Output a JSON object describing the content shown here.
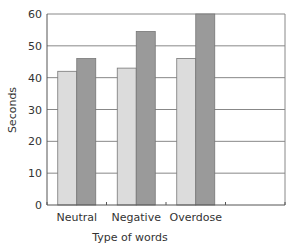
{
  "chart_data": {
    "type": "bar",
    "title": "",
    "xlabel": "Type of words",
    "ylabel": "Seconds",
    "categories": [
      "Neutral",
      "Negative",
      "Overdose"
    ],
    "series": [
      {
        "name": "Series 1",
        "color": "#dcdcdc",
        "values": [
          42,
          43,
          46
        ]
      },
      {
        "name": "Series 2",
        "color": "#9a9a9a",
        "values": [
          46,
          54.5,
          60
        ]
      }
    ],
    "ylim": [
      0,
      60
    ],
    "yticks": [
      0,
      10,
      20,
      30,
      40,
      50,
      60
    ],
    "grid": true,
    "legend": "none",
    "empty_slots": 1
  }
}
